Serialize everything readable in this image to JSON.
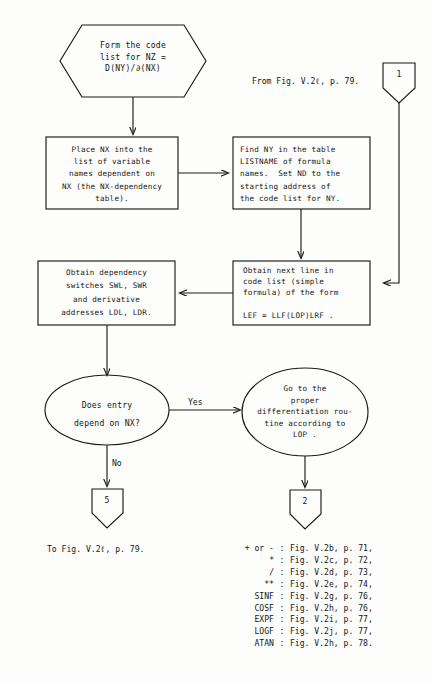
{
  "diagram": {
    "type": "flowchart",
    "nodes": {
      "start_hexagon": {
        "shape": "hexagon",
        "text": "Form the code\nlist for NZ =\nD(NY)/∂(NX)"
      },
      "place_nx_box": {
        "shape": "rectangle",
        "text": "Place NX into the\nlist of variable\nnames dependent on\nNX (the NX-dependency\ntable)."
      },
      "find_ny_box": {
        "shape": "rectangle",
        "text": "Find NY in the table\nLISTNAME of formula\nnames.  Set ND to the\nstarting address of\nthe code list for NY."
      },
      "obtain_switches_box": {
        "shape": "rectangle",
        "text": "Obtain dependency\nswitches SWL, SWR\nand derivative\naddresses LDL, LDR."
      },
      "obtain_next_line_box": {
        "shape": "rectangle",
        "text": "Obtain next line in\ncode list (simple\nformula) of the form\n\nLEF = LLF(LOP)LRF ."
      },
      "decision_ellipse": {
        "shape": "ellipse",
        "text": "Does entry\ndepend on NX?"
      },
      "goto_routine_ellipse": {
        "shape": "ellipse",
        "text": "Go to the\nproper\ndifferentiation rou-\ntine according to\nLOP ."
      }
    },
    "edge_labels": {
      "yes": "Yes",
      "no": "No"
    },
    "connectors": {
      "in_top_right": "1",
      "out_bottom_left": "5",
      "out_bottom_right": "2"
    },
    "captions": {
      "from_fig": "From Fig. V.2ℓ, p. 79.",
      "to_fig": "To Fig. V.2ℓ, p. 79."
    },
    "legend": [
      {
        "key": "+ or -",
        "colon": ":",
        "ref": "Fig. V.2b, p. 71,"
      },
      {
        "key": "*",
        "colon": ":",
        "ref": "Fig. V.2c, p. 72,"
      },
      {
        "key": "/",
        "colon": ":",
        "ref": "Fig. V.2d, p. 73,"
      },
      {
        "key": "**",
        "colon": ":",
        "ref": "Fig. V.2e, p. 74,"
      },
      {
        "key": "SINF",
        "colon": ":",
        "ref": "Fig. V.2g, p. 76,"
      },
      {
        "key": "COSF",
        "colon": ":",
        "ref": "Fig. V.2h, p. 76,"
      },
      {
        "key": "EXPF",
        "colon": ":",
        "ref": "Fig. V.2i, p. 77,"
      },
      {
        "key": "LOGF",
        "colon": ":",
        "ref": "Fig. V.2j, p. 77,"
      },
      {
        "key": "ATAN",
        "colon": ":",
        "ref": "Fig. V.2h, p. 78."
      }
    ],
    "colors": {
      "stroke": "#1a1a1a",
      "background": "#fdfdfb",
      "text": "#161616"
    }
  }
}
